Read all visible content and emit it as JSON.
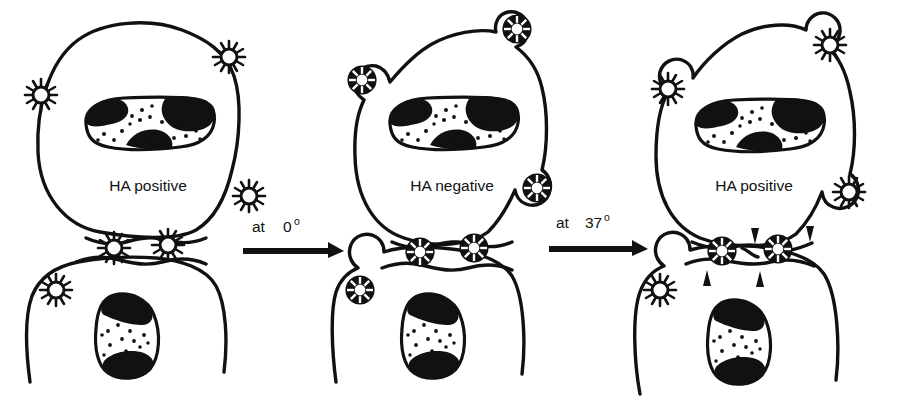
{
  "figure": {
    "background_color": "#ffffff",
    "ink_color": "#111111",
    "panels": [
      {
        "id": "panel-1",
        "label": "HA positive",
        "upper_cell_label": "HA positive",
        "virion_type": "spiked",
        "virion_type_name": "HA-positive spiked virion",
        "junction_virions": 2,
        "free_virions": 4,
        "arrowheads": 0
      },
      {
        "id": "panel-2",
        "label": "HA negative",
        "upper_cell_label": "HA negative",
        "virion_type": "ringed",
        "virion_type_name": "HA-negative ringed virion",
        "junction_virions": 2,
        "free_virions": 4,
        "arrowheads": 0
      },
      {
        "id": "panel-3",
        "label": "HA positive",
        "upper_cell_label": "HA positive",
        "virion_type": "mixed",
        "virion_type_name": "spiked virions on surface, ringed virions at junction",
        "junction_virions": 2,
        "free_virions": 3,
        "arrowheads": 4
      }
    ],
    "arrows": [
      {
        "id": "arrow-1",
        "text": "at",
        "value": "0",
        "degree_symbol": "o",
        "full_label": "at 0o",
        "direction": "right"
      },
      {
        "id": "arrow-2",
        "text": "at",
        "value": "37",
        "degree_symbol": "o",
        "full_label": "at 37o",
        "direction": "right"
      }
    ],
    "legend_notes": {
      "nucleus": "stippled nucleus with dark heterochromatin patches",
      "arrowhead_meaning": "arrowheads mark fusion sites at the cell-cell junction"
    }
  }
}
